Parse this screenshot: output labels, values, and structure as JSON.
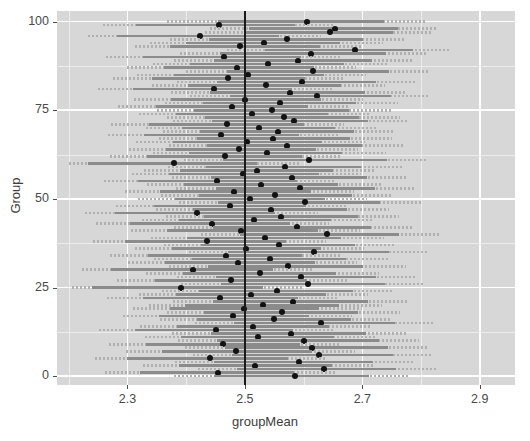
{
  "chart_data": {
    "type": "scatter",
    "title": "",
    "xlabel": "groupMean",
    "ylabel": "Group",
    "xlim": [
      2.18,
      2.96
    ],
    "ylim": [
      -2.5,
      103
    ],
    "xticks": [
      "2.3",
      "2.5",
      "2.7",
      "2.9"
    ],
    "xtick_values": [
      2.3,
      2.5,
      2.7,
      2.9
    ],
    "yticks": [
      "0",
      "25",
      "50",
      "75",
      "100"
    ],
    "ytick_values": [
      0,
      25,
      50,
      75,
      100
    ],
    "x_minor_values": [
      2.2,
      2.4,
      2.6,
      2.8,
      2.9
    ],
    "y_minor_values": [
      12.5,
      37.5,
      62.5,
      87.5
    ],
    "grid": true,
    "legend": "none",
    "reference_line": {
      "orientation": "vertical",
      "x": 2.5,
      "color": "#1a1a1a"
    },
    "panel_background": "#d7d7d7",
    "grid_major_color": "#ffffff",
    "grid_minor_color": "#ececec",
    "interval_color": "#8b8b8b",
    "interval_outside_color": "#b0b0b0",
    "point_color": "#121212",
    "series_name": "groupMean with confidence interval",
    "point_label": "group mean",
    "interval_label": "confidence interval",
    "points": [
      {
        "group": 100,
        "mean": 2.606,
        "lo": 2.455,
        "hi": 2.737,
        "out_lo": 2.367,
        "out_hi": 2.806
      },
      {
        "group": 99,
        "mean": 2.456,
        "lo": 2.315,
        "hi": 2.586,
        "out_lo": 2.258,
        "out_hi": 2.651
      },
      {
        "group": 98,
        "mean": 2.654,
        "lo": 2.507,
        "hi": 2.76,
        "out_lo": 2.441,
        "out_hi": 2.827
      },
      {
        "group": 97,
        "mean": 2.645,
        "lo": 2.5,
        "hi": 2.752,
        "out_lo": 2.432,
        "out_hi": 2.818
      },
      {
        "group": 96,
        "mean": 2.424,
        "lo": 2.282,
        "hi": 2.558,
        "out_lo": 2.233,
        "out_hi": 2.629
      },
      {
        "group": 95,
        "mean": 2.571,
        "lo": 2.439,
        "hi": 2.701,
        "out_lo": 2.372,
        "out_hi": 2.772
      },
      {
        "group": 94,
        "mean": 2.532,
        "lo": 2.4,
        "hi": 2.662,
        "out_lo": 2.338,
        "out_hi": 2.736
      },
      {
        "group": 93,
        "mean": 2.492,
        "lo": 2.373,
        "hi": 2.628,
        "out_lo": 2.312,
        "out_hi": 2.7
      },
      {
        "group": 92,
        "mean": 2.688,
        "lo": 2.535,
        "hi": 2.786,
        "out_lo": 2.47,
        "out_hi": 2.851
      },
      {
        "group": 91,
        "mean": 2.612,
        "lo": 2.458,
        "hi": 2.74,
        "out_lo": 2.39,
        "out_hi": 2.81
      },
      {
        "group": 90,
        "mean": 2.464,
        "lo": 2.326,
        "hi": 2.595,
        "out_lo": 2.264,
        "out_hi": 2.662
      },
      {
        "group": 89,
        "mean": 2.59,
        "lo": 2.447,
        "hi": 2.716,
        "out_lo": 2.379,
        "out_hi": 2.785
      },
      {
        "group": 88,
        "mean": 2.54,
        "lo": 2.406,
        "hi": 2.668,
        "out_lo": 2.344,
        "out_hi": 2.742
      },
      {
        "group": 87,
        "mean": 2.486,
        "lo": 2.362,
        "hi": 2.618,
        "out_lo": 2.3,
        "out_hi": 2.69
      },
      {
        "group": 86,
        "mean": 2.616,
        "lo": 2.469,
        "hi": 2.745,
        "out_lo": 2.4,
        "out_hi": 2.812
      },
      {
        "group": 85,
        "mean": 2.506,
        "lo": 2.379,
        "hi": 2.634,
        "out_lo": 2.316,
        "out_hi": 2.706
      },
      {
        "group": 84,
        "mean": 2.472,
        "lo": 2.341,
        "hi": 2.602,
        "out_lo": 2.276,
        "out_hi": 2.67
      },
      {
        "group": 83,
        "mean": 2.598,
        "lo": 2.452,
        "hi": 2.724,
        "out_lo": 2.385,
        "out_hi": 2.792
      },
      {
        "group": 82,
        "mean": 2.536,
        "lo": 2.403,
        "hi": 2.664,
        "out_lo": 2.341,
        "out_hi": 2.738
      },
      {
        "group": 81,
        "mean": 2.448,
        "lo": 2.309,
        "hi": 2.58,
        "out_lo": 2.25,
        "out_hi": 2.648
      },
      {
        "group": 80,
        "mean": 2.576,
        "lo": 2.441,
        "hi": 2.704,
        "out_lo": 2.374,
        "out_hi": 2.775
      },
      {
        "group": 79,
        "mean": 2.622,
        "lo": 2.474,
        "hi": 2.748,
        "out_lo": 2.407,
        "out_hi": 2.816
      },
      {
        "group": 78,
        "mean": 2.5,
        "lo": 2.374,
        "hi": 2.629,
        "out_lo": 2.311,
        "out_hi": 2.701
      },
      {
        "group": 77,
        "mean": 2.56,
        "lo": 2.428,
        "hi": 2.69,
        "out_lo": 2.364,
        "out_hi": 2.76
      },
      {
        "group": 76,
        "mean": 2.478,
        "lo": 2.349,
        "hi": 2.608,
        "out_lo": 2.284,
        "out_hi": 2.679
      },
      {
        "group": 75,
        "mean": 2.546,
        "lo": 2.414,
        "hi": 2.677,
        "out_lo": 2.35,
        "out_hi": 2.748
      },
      {
        "group": 74,
        "mean": 2.512,
        "lo": 2.383,
        "hi": 2.641,
        "out_lo": 2.32,
        "out_hi": 2.712
      },
      {
        "group": 73,
        "mean": 2.566,
        "lo": 2.432,
        "hi": 2.695,
        "out_lo": 2.368,
        "out_hi": 2.765
      },
      {
        "group": 72,
        "mean": 2.584,
        "lo": 2.444,
        "hi": 2.71,
        "out_lo": 2.377,
        "out_hi": 2.78
      },
      {
        "group": 71,
        "mean": 2.47,
        "lo": 2.337,
        "hi": 2.6,
        "out_lo": 2.272,
        "out_hi": 2.668
      },
      {
        "group": 70,
        "mean": 2.524,
        "lo": 2.393,
        "hi": 2.654,
        "out_lo": 2.331,
        "out_hi": 2.726
      },
      {
        "group": 69,
        "mean": 2.556,
        "lo": 2.424,
        "hi": 2.686,
        "out_lo": 2.36,
        "out_hi": 2.756
      },
      {
        "group": 68,
        "mean": 2.46,
        "lo": 2.329,
        "hi": 2.592,
        "out_lo": 2.267,
        "out_hi": 2.659
      },
      {
        "group": 67,
        "mean": 2.548,
        "lo": 2.418,
        "hi": 2.679,
        "out_lo": 2.353,
        "out_hi": 2.75
      },
      {
        "group": 66,
        "mean": 2.504,
        "lo": 2.377,
        "hi": 2.632,
        "out_lo": 2.314,
        "out_hi": 2.704
      },
      {
        "group": 65,
        "mean": 2.572,
        "lo": 2.436,
        "hi": 2.7,
        "out_lo": 2.37,
        "out_hi": 2.77
      },
      {
        "group": 64,
        "mean": 2.49,
        "lo": 2.366,
        "hi": 2.621,
        "out_lo": 2.303,
        "out_hi": 2.693
      },
      {
        "group": 63,
        "mean": 2.538,
        "lo": 2.405,
        "hi": 2.666,
        "out_lo": 2.343,
        "out_hi": 2.74
      },
      {
        "group": 62,
        "mean": 2.466,
        "lo": 2.333,
        "hi": 2.597,
        "out_lo": 2.27,
        "out_hi": 2.664
      },
      {
        "group": 61,
        "mean": 2.61,
        "lo": 2.462,
        "hi": 2.742,
        "out_lo": 2.396,
        "out_hi": 2.808
      },
      {
        "group": 60,
        "mean": 2.38,
        "lo": 2.232,
        "hi": 2.52,
        "out_lo": 2.2,
        "out_hi": 2.592
      },
      {
        "group": 59,
        "mean": 2.568,
        "lo": 2.434,
        "hi": 2.697,
        "out_lo": 2.369,
        "out_hi": 2.768
      },
      {
        "group": 58,
        "mean": 2.52,
        "lo": 2.39,
        "hi": 2.65,
        "out_lo": 2.328,
        "out_hi": 2.722
      },
      {
        "group": 57,
        "mean": 2.496,
        "lo": 2.371,
        "hi": 2.626,
        "out_lo": 2.308,
        "out_hi": 2.698
      },
      {
        "group": 56,
        "mean": 2.58,
        "lo": 2.443,
        "hi": 2.708,
        "out_lo": 2.376,
        "out_hi": 2.778
      },
      {
        "group": 55,
        "mean": 2.452,
        "lo": 2.318,
        "hi": 2.588,
        "out_lo": 2.26,
        "out_hi": 2.654
      },
      {
        "group": 54,
        "mean": 2.528,
        "lo": 2.396,
        "hi": 2.658,
        "out_lo": 2.334,
        "out_hi": 2.732
      },
      {
        "group": 53,
        "mean": 2.594,
        "lo": 2.45,
        "hi": 2.722,
        "out_lo": 2.383,
        "out_hi": 2.789
      },
      {
        "group": 52,
        "mean": 2.482,
        "lo": 2.356,
        "hi": 2.612,
        "out_lo": 2.295,
        "out_hi": 2.685
      },
      {
        "group": 51,
        "mean": 2.552,
        "lo": 2.421,
        "hi": 2.683,
        "out_lo": 2.357,
        "out_hi": 2.753
      },
      {
        "group": 50,
        "mean": 2.508,
        "lo": 2.381,
        "hi": 2.637,
        "out_lo": 2.318,
        "out_hi": 2.708
      },
      {
        "group": 49,
        "mean": 2.602,
        "lo": 2.454,
        "hi": 2.73,
        "out_lo": 2.388,
        "out_hi": 2.8
      },
      {
        "group": 48,
        "mean": 2.474,
        "lo": 2.345,
        "hi": 2.604,
        "out_lo": 2.28,
        "out_hi": 2.674
      },
      {
        "group": 47,
        "mean": 2.544,
        "lo": 2.412,
        "hi": 2.674,
        "out_lo": 2.348,
        "out_hi": 2.745
      },
      {
        "group": 46,
        "mean": 2.418,
        "lo": 2.278,
        "hi": 2.552,
        "out_lo": 2.228,
        "out_hi": 2.624
      },
      {
        "group": 45,
        "mean": 2.562,
        "lo": 2.43,
        "hi": 2.692,
        "out_lo": 2.366,
        "out_hi": 2.762
      },
      {
        "group": 44,
        "mean": 2.516,
        "lo": 2.387,
        "hi": 2.646,
        "out_lo": 2.324,
        "out_hi": 2.718
      },
      {
        "group": 43,
        "mean": 2.444,
        "lo": 2.305,
        "hi": 2.576,
        "out_lo": 2.246,
        "out_hi": 2.644
      },
      {
        "group": 42,
        "mean": 2.588,
        "lo": 2.446,
        "hi": 2.714,
        "out_lo": 2.38,
        "out_hi": 2.784
      },
      {
        "group": 41,
        "mean": 2.494,
        "lo": 2.368,
        "hi": 2.624,
        "out_lo": 2.306,
        "out_hi": 2.696
      },
      {
        "group": 40,
        "mean": 2.64,
        "lo": 2.492,
        "hi": 2.762,
        "out_lo": 2.425,
        "out_hi": 2.83
      },
      {
        "group": 39,
        "mean": 2.534,
        "lo": 2.402,
        "hi": 2.663,
        "out_lo": 2.34,
        "out_hi": 2.737
      },
      {
        "group": 38,
        "mean": 2.436,
        "lo": 2.296,
        "hi": 2.57,
        "out_lo": 2.241,
        "out_hi": 2.638
      },
      {
        "group": 37,
        "mean": 2.558,
        "lo": 2.426,
        "hi": 2.688,
        "out_lo": 2.362,
        "out_hi": 2.758
      },
      {
        "group": 36,
        "mean": 2.502,
        "lo": 2.375,
        "hi": 2.63,
        "out_lo": 2.313,
        "out_hi": 2.702
      },
      {
        "group": 35,
        "mean": 2.618,
        "lo": 2.471,
        "hi": 2.746,
        "out_lo": 2.404,
        "out_hi": 2.814
      },
      {
        "group": 34,
        "mean": 2.468,
        "lo": 2.335,
        "hi": 2.598,
        "out_lo": 2.271,
        "out_hi": 2.666
      },
      {
        "group": 33,
        "mean": 2.542,
        "lo": 2.41,
        "hi": 2.672,
        "out_lo": 2.346,
        "out_hi": 2.743
      },
      {
        "group": 32,
        "mean": 2.488,
        "lo": 2.364,
        "hi": 2.62,
        "out_lo": 2.301,
        "out_hi": 2.691
      },
      {
        "group": 31,
        "mean": 2.574,
        "lo": 2.438,
        "hi": 2.702,
        "out_lo": 2.371,
        "out_hi": 2.774
      },
      {
        "group": 30,
        "mean": 2.412,
        "lo": 2.272,
        "hi": 2.548,
        "out_lo": 2.222,
        "out_hi": 2.618
      },
      {
        "group": 29,
        "mean": 2.526,
        "lo": 2.394,
        "hi": 2.656,
        "out_lo": 2.332,
        "out_hi": 2.728
      },
      {
        "group": 28,
        "mean": 2.596,
        "lo": 2.451,
        "hi": 2.723,
        "out_lo": 2.384,
        "out_hi": 2.79
      },
      {
        "group": 27,
        "mean": 2.476,
        "lo": 2.347,
        "hi": 2.606,
        "out_lo": 2.282,
        "out_hi": 2.676
      },
      {
        "group": 26,
        "mean": 2.608,
        "lo": 2.46,
        "hi": 2.738,
        "out_lo": 2.392,
        "out_hi": 2.804
      },
      {
        "group": 25,
        "mean": 2.392,
        "lo": 2.24,
        "hi": 2.53,
        "out_lo": 2.206,
        "out_hi": 2.6
      },
      {
        "group": 24,
        "mean": 2.554,
        "lo": 2.422,
        "hi": 2.684,
        "out_lo": 2.358,
        "out_hi": 2.754
      },
      {
        "group": 23,
        "mean": 2.51,
        "lo": 2.382,
        "hi": 2.638,
        "out_lo": 2.319,
        "out_hi": 2.71
      },
      {
        "group": 22,
        "mean": 2.458,
        "lo": 2.327,
        "hi": 2.59,
        "out_lo": 2.266,
        "out_hi": 2.658
      },
      {
        "group": 21,
        "mean": 2.582,
        "lo": 2.445,
        "hi": 2.709,
        "out_lo": 2.378,
        "out_hi": 2.779
      },
      {
        "group": 20,
        "mean": 2.53,
        "lo": 2.398,
        "hi": 2.66,
        "out_lo": 2.336,
        "out_hi": 2.734
      },
      {
        "group": 19,
        "mean": 2.498,
        "lo": 2.372,
        "hi": 2.627,
        "out_lo": 2.31,
        "out_hi": 2.699
      },
      {
        "group": 18,
        "mean": 2.564,
        "lo": 2.431,
        "hi": 2.693,
        "out_lo": 2.367,
        "out_hi": 2.764
      },
      {
        "group": 17,
        "mean": 2.48,
        "lo": 2.353,
        "hi": 2.61,
        "out_lo": 2.292,
        "out_hi": 2.682
      },
      {
        "group": 16,
        "mean": 2.55,
        "lo": 2.419,
        "hi": 2.681,
        "out_lo": 2.355,
        "out_hi": 2.751
      },
      {
        "group": 15,
        "mean": 2.63,
        "lo": 2.482,
        "hi": 2.756,
        "out_lo": 2.415,
        "out_hi": 2.822
      },
      {
        "group": 14,
        "mean": 2.514,
        "lo": 2.385,
        "hi": 2.643,
        "out_lo": 2.322,
        "out_hi": 2.714
      },
      {
        "group": 13,
        "mean": 2.45,
        "lo": 2.312,
        "hi": 2.582,
        "out_lo": 2.252,
        "out_hi": 2.65
      },
      {
        "group": 12,
        "mean": 2.578,
        "lo": 2.442,
        "hi": 2.706,
        "out_lo": 2.375,
        "out_hi": 2.776
      },
      {
        "group": 11,
        "mean": 2.522,
        "lo": 2.392,
        "hi": 2.652,
        "out_lo": 2.33,
        "out_hi": 2.724
      },
      {
        "group": 10,
        "mean": 2.6,
        "lo": 2.453,
        "hi": 2.728,
        "out_lo": 2.386,
        "out_hi": 2.796
      },
      {
        "group": 9,
        "mean": 2.462,
        "lo": 2.331,
        "hi": 2.594,
        "out_lo": 2.268,
        "out_hi": 2.66
      },
      {
        "group": 8,
        "mean": 2.614,
        "lo": 2.466,
        "hi": 2.744,
        "out_lo": 2.398,
        "out_hi": 2.81
      },
      {
        "group": 7,
        "mean": 2.484,
        "lo": 2.359,
        "hi": 2.614,
        "out_lo": 2.298,
        "out_hi": 2.687
      },
      {
        "group": 6,
        "mean": 2.626,
        "lo": 2.478,
        "hi": 2.752,
        "out_lo": 2.412,
        "out_hi": 2.82
      },
      {
        "group": 5,
        "mean": 2.44,
        "lo": 2.3,
        "hi": 2.574,
        "out_lo": 2.244,
        "out_hi": 2.64
      },
      {
        "group": 4,
        "mean": 2.592,
        "lo": 2.448,
        "hi": 2.718,
        "out_lo": 2.381,
        "out_hi": 2.787
      },
      {
        "group": 3,
        "mean": 2.518,
        "lo": 2.388,
        "hi": 2.648,
        "out_lo": 2.326,
        "out_hi": 2.72
      },
      {
        "group": 2,
        "mean": 2.634,
        "lo": 2.486,
        "hi": 2.758,
        "out_lo": 2.42,
        "out_hi": 2.826
      },
      {
        "group": 1,
        "mean": 2.454,
        "lo": 2.321,
        "hi": 2.584,
        "out_lo": 2.262,
        "out_hi": 2.656
      },
      {
        "group": 0,
        "mean": 2.586,
        "lo": 2.447,
        "hi": 2.712,
        "out_lo": 2.379,
        "out_hi": 2.782
      }
    ]
  }
}
